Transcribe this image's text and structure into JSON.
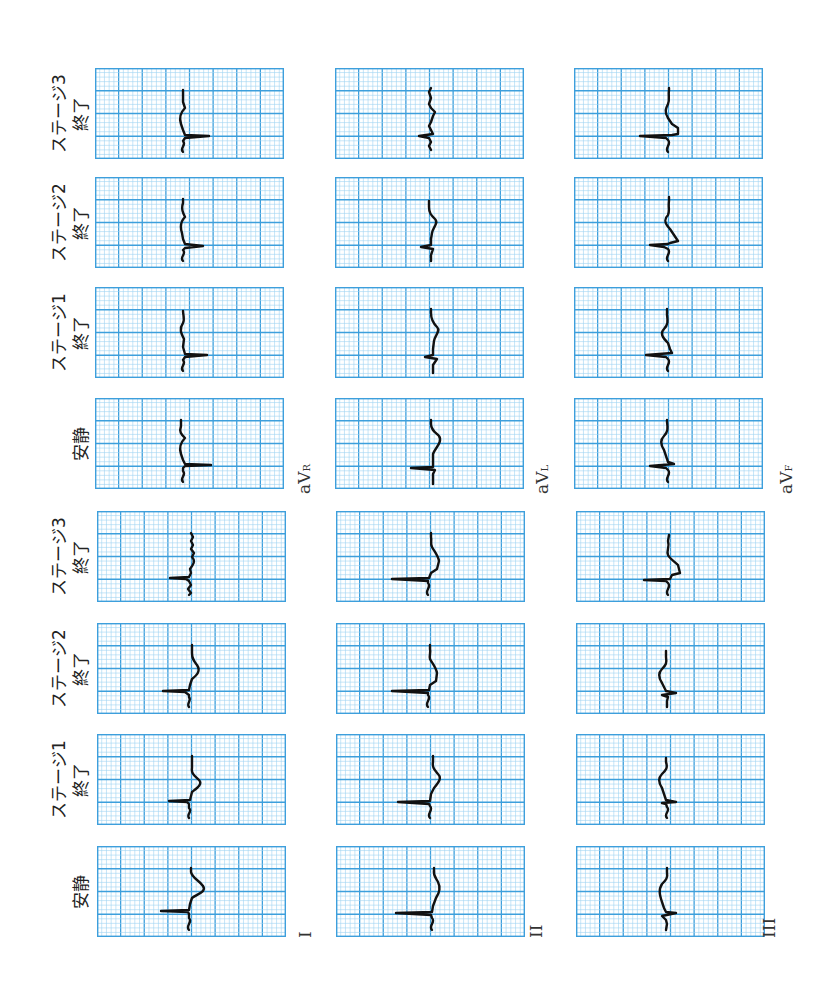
{
  "figure": {
    "orientation": "rotated-90-ccw",
    "grid_colors": {
      "major": "#3d9fdc",
      "minor": "#9fd3f2",
      "border": "#3d9fdc",
      "trace": "#111111"
    }
  },
  "stages": [
    {
      "id": "rest",
      "line1": "安静",
      "line2": ""
    },
    {
      "id": "stage1",
      "line1": "ステージ1",
      "line2": "終了"
    },
    {
      "id": "stage2",
      "line1": "ステージ2",
      "line2": "終了"
    },
    {
      "id": "stage3",
      "line1": "ステージ3",
      "line2": "終了"
    }
  ],
  "leads": [
    {
      "id": "I",
      "label": "I",
      "sub": ""
    },
    {
      "id": "II",
      "label": "II",
      "sub": ""
    },
    {
      "id": "III",
      "label": "III",
      "sub": ""
    },
    {
      "id": "aVR",
      "label": "aV",
      "sub": "R"
    },
    {
      "id": "aVL",
      "label": "aV",
      "sub": "L"
    },
    {
      "id": "aVF",
      "label": "aV",
      "sub": "F"
    }
  ],
  "chart_data": {
    "type": "line",
    "title": "",
    "categories": [
      "安静",
      "ステージ1 終了",
      "ステージ2 終了",
      "ステージ3 終了"
    ],
    "grid": {
      "major_divisions_x": 8,
      "major_divisions_y": 4,
      "minor_per_major": 5
    },
    "series": [
      {
        "name": "I",
        "traces": [
          {
            "stage": "安静",
            "path": "M92,84 C88,80 96,76 92,72 L92,68 L91,66 L64,65 L92,64 L93,58 L95,52 C100,48 110,46 106,40 C102,34 95,32 94,26 L94,22"
          },
          {
            "stage": "ステージ1 終了",
            "path": "M92,84 C89,80 96,78 92,74 L92,70 L90,68 L72,67 L93,66 L94,62 L95,58 C100,54 106,50 102,46 C98,42 94,40 95,34 L95,22"
          },
          {
            "stage": "ステージ2 終了",
            "path": "M92,84 C89,80 95,78 92,74 L92,72 L88,69 L66,68 L92,67 L93,62 L95,56 C100,52 104,48 100,42 C97,38 95,36 95,30 L95,22"
          },
          {
            "stage": "ステージ3 終了",
            "path": "M92,84 L94,82 L91,78 L94,74 L92,70 L89,68 L73,67 L92,66 L94,62 L93,58 C96,54 99,50 95,46 L97,42 L94,38 L96,34 L94,30 L96,26 L94,22"
          }
        ]
      },
      {
        "name": "II",
        "traces": [
          {
            "stage": "安静",
            "path": "M96,84 C92,80 100,76 96,72 L95,69 L60,67 L96,66 L97,60 L100,52 C104,46 104,40 102,36 C100,32 97,30 98,24 L98,22"
          },
          {
            "stage": "ステージ1 終了",
            "path": "M94,84 C90,80 98,76 94,72 L93,70 L62,68 L94,67 L95,60 L98,54 C103,48 106,44 102,40 C99,36 96,34 97,28 L97,22"
          },
          {
            "stage": "ステージ2 終了",
            "path": "M92,84 C88,80 96,76 92,72 L92,70 L56,68 L93,67 L94,62 L100,58 L101,50 C100,44 96,40 94,36 C93,32 95,30 94,26 L94,22"
          },
          {
            "stage": "ステージ3 終了",
            "path": "M92,84 C88,80 96,76 92,72 L92,70 L56,68 L93,67 L95,62 L101,58 L103,50 C102,44 98,40 96,36 C94,32 96,30 95,26 L95,22"
          }
        ]
      },
      {
        "name": "III",
        "traces": [
          {
            "stage": "安静",
            "path": "M90,84 L91,78 L90,74 L86,70 L100,67 L90,66 L88,62 L86,56 C84,50 82,44 86,38 C90,34 92,32 91,26 L91,22"
          },
          {
            "stage": "ステージ1 終了",
            "path": "M91,84 C87,80 95,77 91,73 L90,70 L86,69 L100,68 L90,66 L88,60 L86,54 C82,48 82,44 86,40 C90,36 92,34 90,28 L90,24"
          },
          {
            "stage": "ステージ2 終了",
            "path": "M91,84 L91,78 L92,74 L86,72 L100,70 L90,68 L88,64 L86,60 C82,54 82,50 86,46 C90,42 91,40 90,34 L90,28"
          },
          {
            "stage": "ステージ3 終了",
            "path": "M92,84 C88,80 96,76 92,72 L90,70 L68,69 L94,68 L96,64 L104,62 L102,54 C98,50 94,48 92,44 C90,40 94,36 92,30 L93,24"
          }
        ]
      },
      {
        "name": "aVR",
        "traces": [
          {
            "stage": "安静",
            "path": "M88,84 C84,80 92,77 88,73 L88,70 L90,68 L116,67 L90,66 L88,62 L86,56 C84,50 86,44 90,40 C86,36 84,34 86,28 L86,22"
          },
          {
            "stage": "ステージ1 終了",
            "path": "M88,84 C84,80 92,77 88,73 L90,70 L112,68 L90,67 L88,60 L89,52 C86,46 84,42 88,36 C90,32 88,28 88,24"
          },
          {
            "stage": "ステージ2 終了",
            "path": "M88,84 C84,80 92,77 88,73 L90,71 L108,69 L90,67 L88,62 L87,56 C85,50 86,44 90,40 C88,36 86,32 88,26 L88,22"
          },
          {
            "stage": "ステージ3 終了",
            "path": "M88,84 C84,80 92,77 88,73 L90,70 L114,68 L90,67 L88,62 L86,56 C84,50 86,44 90,40 L88,34 L88,22"
          }
        ]
      },
      {
        "name": "aVL",
        "traces": [
          {
            "stage": "安静",
            "path": "M98,86 L98,76 L100,72 L76,70 L98,69 L98,64 L98,56 C100,50 108,44 104,38 C100,34 96,32 96,26 L96,22"
          },
          {
            "stage": "ステージ1 終了",
            "path": "M98,86 L98,78 L102,72 L90,70 L98,68 L98,62 L99,54 C100,48 106,44 102,40 C98,36 96,32 96,26 L96,22"
          },
          {
            "stage": "ステージ2 終了",
            "path": "M96,84 L96,78 L98,72 L86,70 L96,68 L96,62 L97,56 C98,50 104,46 100,42 C96,38 94,36 94,30 L94,24"
          },
          {
            "stage": "ステージ3 終了",
            "path": "M96,82 L94,78 L96,74 L94,70 L84,68 L98,66 L96,62 L94,58 L96,54 L98,48 L100,44 L96,40 L94,36 L96,30 L94,24 L96,20"
          }
        ]
      },
      {
        "name": "aVF",
        "traces": [
          {
            "stage": "安静",
            "path": "M94,84 C90,80 98,76 94,72 L92,70 L76,68 L100,66 L94,64 L92,58 L90,52 C86,46 86,42 90,38 C94,34 94,30 93,24 L93,22"
          },
          {
            "stage": "ステージ1 終了",
            "path": "M94,84 C90,80 98,76 94,72 L92,70 L72,68 L98,66 L96,62 L94,56 C88,50 86,46 90,42 C94,38 94,34 93,28 L93,22"
          },
          {
            "stage": "ステージ2 終了",
            "path": "M94,84 C90,80 98,76 94,72 L90,70 L76,68 L94,67 L96,66 L104,64 L100,58 L96,52 C90,46 90,42 94,38 C96,34 94,30 95,24 L95,20"
          },
          {
            "stage": "ステージ3 終了",
            "path": "M94,84 C90,80 98,76 94,72 L92,70 L66,68 L98,67 L104,66 L104,60 L98,56 L94,50 C90,44 92,40 94,36 C96,32 94,28 95,22 L95,20"
          }
        ]
      }
    ]
  }
}
